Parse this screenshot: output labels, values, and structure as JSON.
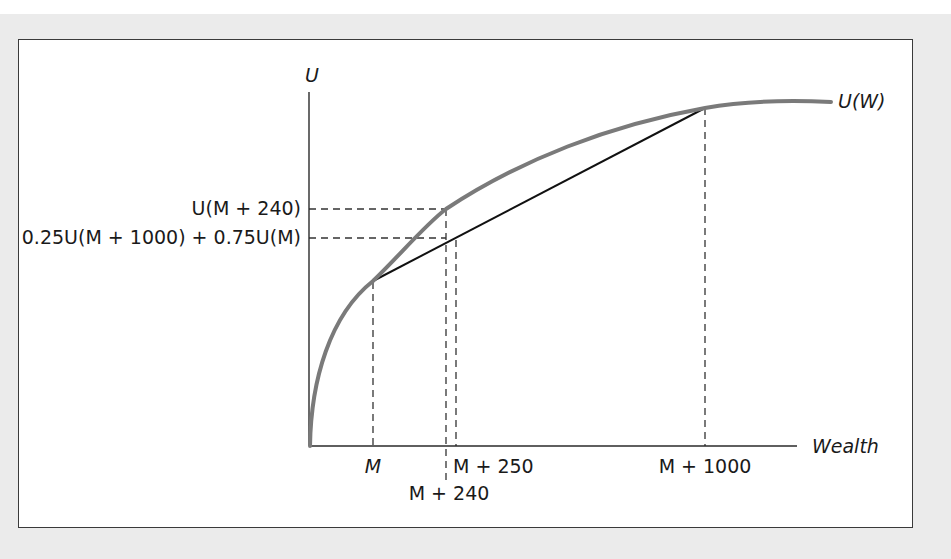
{
  "diagram": {
    "title": "",
    "colors": {
      "background": "#ebebeb",
      "panel": "#ffffff",
      "frame_border": "#3a3a3a",
      "axis": "#2a2a2a",
      "utility_curve": "#7a7a7a",
      "chord": "#111111",
      "dashed": "#333333",
      "text": "#1a1a1a"
    },
    "axes": {
      "y_label": "U",
      "x_label": "Wealth"
    },
    "curve": {
      "label": "U(W)"
    },
    "y_ticks": [
      {
        "id": "u_m_240",
        "label": "U(M + 240)"
      },
      {
        "id": "expected_u",
        "label": "0.25U(M + 1000) + 0.75U(M)"
      }
    ],
    "x_ticks": [
      {
        "id": "m",
        "label": "M"
      },
      {
        "id": "m_240",
        "label": "M + 240"
      },
      {
        "id": "m_250",
        "label": "M + 250"
      },
      {
        "id": "m_1000",
        "label": "M + 1000"
      }
    ],
    "elements": {
      "chord": "Line connecting U(M) and U(M + 1000)",
      "note": "Concave utility function illustrating risk aversion: certainty equivalent M + 240 vs expected value M + 250"
    }
  }
}
